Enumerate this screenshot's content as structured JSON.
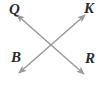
{
  "figure": {
    "type": "geometry-diagram",
    "width": 103,
    "height": 85,
    "background_color": "#ffffff",
    "line_color": "#9a9a9a",
    "label_color": "#2b2b2b",
    "line_width": 1.5,
    "intersection": {
      "x": 51,
      "y": 44
    },
    "labels": [
      {
        "id": "Q",
        "text": "Q",
        "position": "top-left",
        "x": 9,
        "y": 2
      },
      {
        "id": "K",
        "text": "K",
        "position": "top-right",
        "x": 84,
        "y": 1
      },
      {
        "id": "B",
        "text": "B",
        "position": "bottom-left",
        "x": 11,
        "y": 50
      },
      {
        "id": "R",
        "text": "R",
        "position": "bottom-right",
        "x": 85,
        "y": 51
      }
    ],
    "lines": [
      {
        "id": "line-BK",
        "name": "line-b-k",
        "from_label": "B",
        "to_label": "K",
        "arrowheads": "both",
        "x1": 19,
        "y1": 73,
        "x2": 85,
        "y2": 15
      },
      {
        "id": "line-QR",
        "name": "line-q-r",
        "from_label": "Q",
        "to_label": "R",
        "arrowheads": "both",
        "x1": 17,
        "y1": 15,
        "x2": 84,
        "y2": 74
      }
    ]
  }
}
